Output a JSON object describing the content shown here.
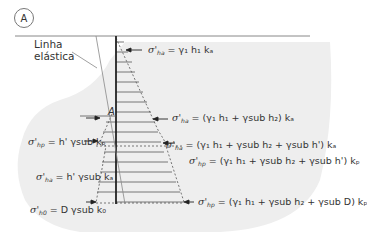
{
  "figure": {
    "badge": "A",
    "callout": {
      "line1": "Linha",
      "line2": "elástica"
    },
    "point_label": "A",
    "colors": {
      "soil": "#eeeeee",
      "wall": "#222222",
      "hatch": "#555555",
      "text": "#333333"
    }
  },
  "equations": {
    "eq1": {
      "sym": "σ'",
      "sub": "ha",
      "rhs": " = γ₁ h₁ kₐ"
    },
    "eq2": {
      "sym": "σ'",
      "sub": "ha",
      "rhs": " = (γ₁ h₁ + γsub h₂) kₐ"
    },
    "eq3": {
      "sym": "σ'",
      "sub": "hp",
      "rhs": " = h' γsub kₚ"
    },
    "eq4": {
      "sym": "σ'",
      "sub": "ha",
      "rhs": " = (γ₁ h₁ + γsub h₂ + γsub h') kₐ"
    },
    "eq5": {
      "sym": "σ'",
      "sub": "hp",
      "rhs": " = (γ₁ h₁ + γsub h₂ + γsub h') kₚ"
    },
    "eq6": {
      "sym": "σ'",
      "sub": "ha",
      "rhs": " = h' γsub kₐ"
    },
    "eq7": {
      "sym": "σ'",
      "sub": "h0",
      "rhs": " = D γsub k₀"
    },
    "eq8": {
      "sym": "σ'",
      "sub": "hp",
      "rhs": " = (γ₁ h₁ + γsub h₂ + γsub D) kₚ"
    }
  }
}
